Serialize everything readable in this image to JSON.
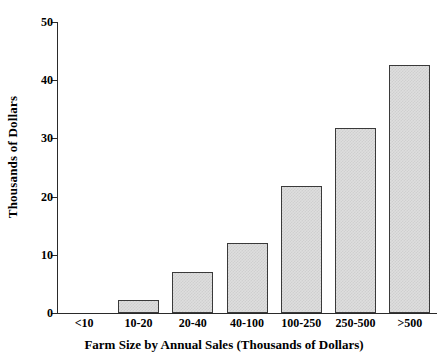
{
  "chart_data": {
    "type": "bar",
    "title": "",
    "subtitle": "",
    "xlabel": "Farm Size by Annual Sales (Thousands of Dollars)",
    "ylabel": "Thousands of Dollars",
    "categories": [
      "<10",
      "10-20",
      "20-40",
      "40-100",
      "100-250",
      "250-500",
      ">500"
    ],
    "values": [
      0,
      2.2,
      7.0,
      12.0,
      21.8,
      31.8,
      42.7
    ],
    "ylim": [
      0,
      50
    ],
    "yticks": [
      0,
      10,
      20,
      30,
      40,
      50
    ],
    "ytick_labels": [
      "0",
      "10",
      "20",
      "30",
      "40",
      "50"
    ],
    "grid": false,
    "legend": false,
    "legend_position": "none",
    "series": [
      {
        "name": "Thousands of Dollars",
        "values": [
          0,
          2.2,
          7.0,
          12.0,
          21.8,
          31.8,
          42.7
        ]
      }
    ],
    "colors": {
      "bar_fill": "#dedede",
      "bar_pattern": "#cfcfcf",
      "bar_border": "#3a3a3a",
      "axis": "#2a2a2a",
      "text": "#000000",
      "background": "#ffffff"
    }
  }
}
